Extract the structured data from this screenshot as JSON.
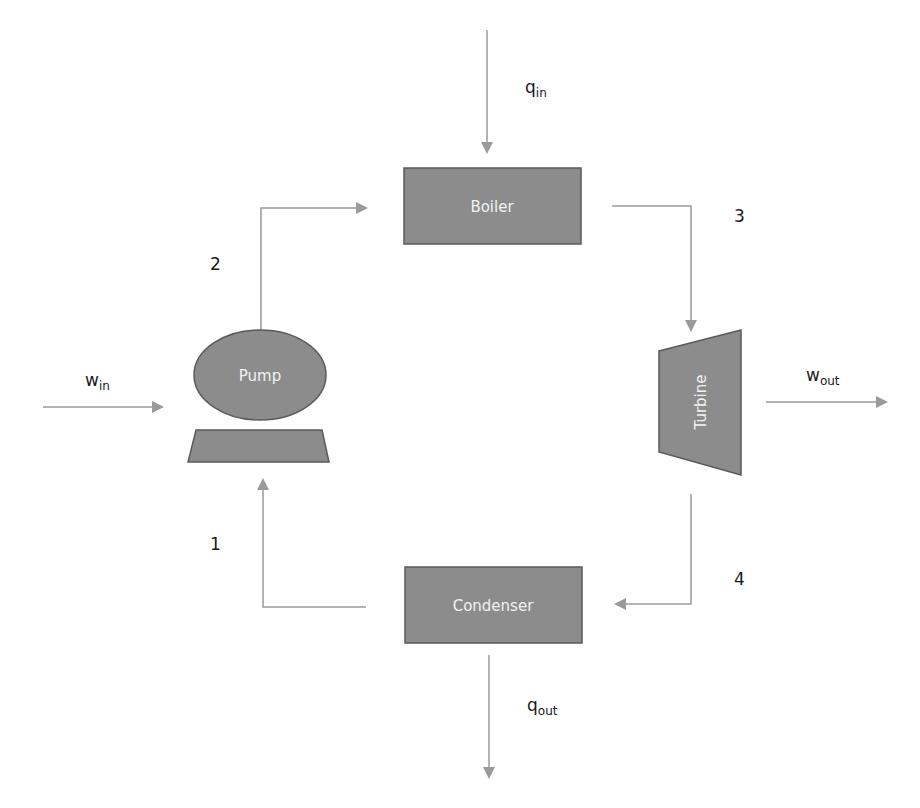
{
  "diagram": {
    "colors": {
      "component_fill": "#8c8c8c",
      "component_stroke": "#5a5a5a",
      "arrow": "#9a9a9a",
      "text": "#1a1a1a",
      "component_text": "#f2f2f2",
      "background": "#ffffff"
    },
    "components": {
      "boiler": {
        "label": "Boiler"
      },
      "turbine": {
        "label": "Turbine"
      },
      "condenser": {
        "label": "Condenser"
      },
      "pump": {
        "label": "Pump"
      }
    },
    "states": [
      {
        "id": "1",
        "label": "1"
      },
      {
        "id": "2",
        "label": "2"
      },
      {
        "id": "3",
        "label": "3"
      },
      {
        "id": "4",
        "label": "4"
      }
    ],
    "energy_flows": {
      "q_in": {
        "symbol": "q",
        "subscript": "in"
      },
      "q_out": {
        "symbol": "q",
        "subscript": "out"
      },
      "w_in": {
        "symbol": "w",
        "subscript": "in"
      },
      "w_out": {
        "symbol": "w",
        "subscript": "out"
      }
    }
  }
}
